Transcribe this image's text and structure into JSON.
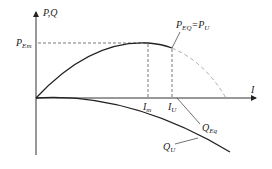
{
  "diagram": {
    "y_axis_label": "P,Q",
    "x_axis_label": "I",
    "p_em_label": {
      "main": "P",
      "sub": "Em"
    },
    "peak_label": {
      "p1": "P",
      "s1": "EQ",
      "eq": "=",
      "p2": "P",
      "s2": "U"
    },
    "i_m_label": {
      "main": "I",
      "sub": "m"
    },
    "i_u_label": {
      "main": "I",
      "sub": "U"
    },
    "q_eq_label": {
      "main": "Q",
      "sub": "Eq"
    },
    "q_u_label": {
      "main": "Q",
      "sub": "U"
    },
    "colors": {
      "line": "#222222",
      "dashed": "#555555",
      "extension": "#aaaaaa"
    }
  }
}
